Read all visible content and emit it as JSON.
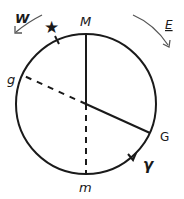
{
  "diagram": {
    "stroke_color": "#1a1a1a",
    "background": "#ffffff",
    "circle": {
      "cx": 86,
      "cy": 104,
      "r": 70
    },
    "labels": {
      "west": "W",
      "east": "E",
      "star": "★",
      "meridian_top": "M",
      "meridian_bottom": "m",
      "g_small": "g",
      "g_large": "G",
      "gamma": "γ"
    }
  }
}
